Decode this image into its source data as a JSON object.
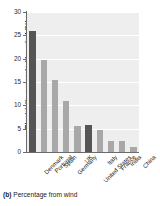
{
  "chart_data": {
    "type": "bar",
    "title": "",
    "xlabel": "",
    "ylabel": "Electricity generated by wind (%)",
    "ylim": [
      0,
      30
    ],
    "yticks": [
      0,
      5,
      10,
      15,
      20,
      25,
      30
    ],
    "ytick_labels": [
      "0",
      "5",
      "10",
      "15",
      "20",
      "25",
      "30"
    ],
    "grid": true,
    "legend": "none",
    "categories": [
      "Denmark",
      "Portugal",
      "Spain",
      "Germany",
      "UK",
      "United States",
      "Italy",
      "France",
      "India",
      "China"
    ],
    "values": [
      26.0,
      19.8,
      15.5,
      11.0,
      5.6,
      5.7,
      4.7,
      2.4,
      2.4,
      1.1
    ],
    "bar_colors": [
      "#555555",
      "#a8a8a8",
      "#a8a8a8",
      "#a8a8a8",
      "#a8a8a8",
      "#555555",
      "#a8a8a8",
      "#a8a8a8",
      "#a8a8a8",
      "#a8a8a8"
    ],
    "plot_background": "#eeeeee",
    "highlight_color": "#555555",
    "bar_color": "#a8a8a8"
  },
  "caption": {
    "marker": "(b)",
    "text": "Percentage from wind"
  }
}
